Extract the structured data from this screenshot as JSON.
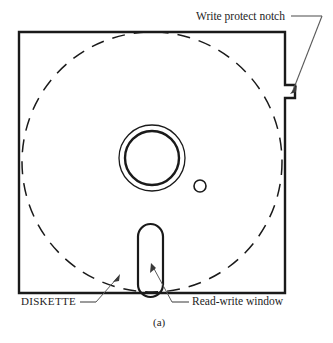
{
  "figure": {
    "caption": "(a)",
    "background_color": "#ffffff",
    "line_color": "#1a1a1a"
  },
  "labels": {
    "write_protect_notch": "Write protect notch",
    "diskette": "DISKETTE",
    "read_write_window": "Read-write window"
  },
  "parts": {
    "jacket": {
      "name": "jacket-square",
      "x": 19,
      "y": 32,
      "width": 266,
      "height": 261
    },
    "media_disk": {
      "name": "dashed-media-circle",
      "cx": 152,
      "cy": 162,
      "r": 130,
      "stroke_style": "dashed"
    },
    "hub_outer": {
      "name": "hub-outer-ring",
      "cx": 152,
      "cy": 158,
      "r": 33
    },
    "hub_inner": {
      "name": "hub-inner-ring",
      "cx": 152,
      "cy": 158,
      "r": 27
    },
    "index_hole": {
      "name": "index-hole",
      "cx": 200,
      "cy": 186,
      "r": 6
    },
    "read_write_window": {
      "name": "read-write-slot",
      "x": 138,
      "y": 224,
      "width": 25,
      "height": 73,
      "radius": 12
    },
    "write_protect_notch": {
      "name": "write-protect-notch",
      "x": 285,
      "y": 85,
      "width": 10,
      "height": 13
    }
  }
}
